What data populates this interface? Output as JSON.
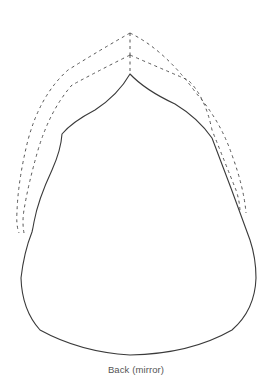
{
  "diagram": {
    "type": "sewing-pattern-piece",
    "piece_label": "Back (mirror)",
    "colors": {
      "background": "#ffffff",
      "outline": "#3a3a3a",
      "seam_allowance": "#555555",
      "caption": "#555555"
    },
    "elements": {
      "cut_line": "solid outline of pattern piece",
      "seam_allowance_inner": "dashed line",
      "seam_allowance_outer": "dashed line"
    }
  }
}
